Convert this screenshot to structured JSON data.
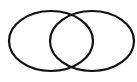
{
  "diagram": {
    "type": "venn",
    "sets": [
      {
        "name": "left-set",
        "cx": 51,
        "cy": 41,
        "rx": 42,
        "ry": 30
      },
      {
        "name": "right-set",
        "cx": 92,
        "cy": 41,
        "rx": 42,
        "ry": 30
      }
    ],
    "stroke_color": "#111111",
    "background": "#ffffff"
  }
}
